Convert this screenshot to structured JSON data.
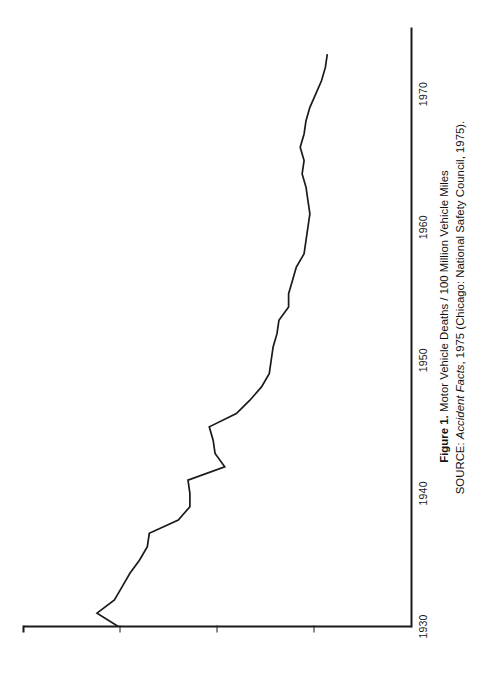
{
  "figure": {
    "caption_bold_prefix": "Figure 1.",
    "caption_title": "Motor Vehicle Deaths / 100 Million Vehicle Miles",
    "source_prefix": "SOURCE:",
    "source_italic": "Accident Facts",
    "source_rest": ", 1975 (Chicago: National Safety Council, 1975).",
    "rotation": "-90deg",
    "line_color": "#1a1a1a",
    "background": "#ffffff"
  },
  "chart_data": {
    "type": "line",
    "title": "Motor Vehicle Deaths / 100 Million Vehicle Miles",
    "xlabel": "",
    "ylabel": "",
    "grid": false,
    "legend": false,
    "xlim": [
      1930,
      1975
    ],
    "ylim": [
      0,
      20
    ],
    "xticks": [
      1930,
      1940,
      1950,
      1960,
      1970
    ],
    "xtick_labels": [
      "1930",
      "1940",
      "1950",
      "1960",
      "1970"
    ],
    "yticks": [
      5,
      10,
      15,
      20
    ],
    "ytick_labels": [
      "5",
      "10",
      "15",
      "20"
    ],
    "series": [
      {
        "name": "Motor Vehicle Death Rate",
        "x": [
          1930,
          1931,
          1932,
          1933,
          1934,
          1935,
          1936,
          1937,
          1938,
          1939,
          1940,
          1941,
          1942,
          1943,
          1944,
          1945,
          1946,
          1947,
          1948,
          1949,
          1950,
          1951,
          1952,
          1953,
          1954,
          1955,
          1956,
          1957,
          1958,
          1959,
          1960,
          1961,
          1962,
          1963,
          1964,
          1965,
          1966,
          1967,
          1968,
          1969,
          1970,
          1971,
          1972,
          1973
        ],
        "values": [
          15.1,
          16.2,
          15.3,
          14.9,
          14.5,
          14.0,
          13.6,
          13.5,
          12.0,
          11.4,
          11.4,
          11.5,
          9.6,
          10.1,
          10.2,
          10.4,
          9.0,
          8.3,
          7.7,
          7.3,
          7.2,
          7.1,
          6.9,
          6.8,
          6.3,
          6.3,
          6.1,
          5.9,
          5.5,
          5.4,
          5.3,
          5.2,
          5.3,
          5.4,
          5.6,
          5.5,
          5.7,
          5.5,
          5.4,
          5.2,
          4.9,
          4.6,
          4.4,
          4.3
        ]
      }
    ]
  },
  "axes": {
    "x_tick_labels": [
      "1930",
      "1940",
      "1950",
      "1960",
      "1970"
    ],
    "y_tick_labels": [
      "20",
      "15",
      "10",
      "5"
    ]
  }
}
